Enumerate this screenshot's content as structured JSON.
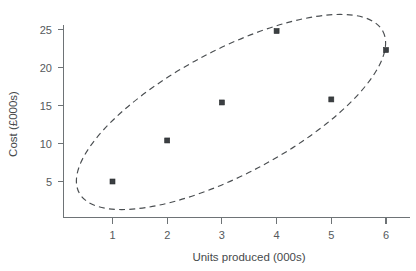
{
  "chart_data": {
    "type": "scatter",
    "title": "",
    "xlabel": "Units produced (000s)",
    "ylabel": "Cost (£000s)",
    "x": [
      1,
      2,
      3,
      4,
      5,
      6
    ],
    "values": [
      5.0,
      10.4,
      15.4,
      24.8,
      15.8,
      22.3
    ],
    "series": [
      {
        "name": "Cost vs units produced",
        "points": [
          {
            "x": 1,
            "y": 5.0
          },
          {
            "x": 2,
            "y": 10.4
          },
          {
            "x": 3,
            "y": 15.4
          },
          {
            "x": 4,
            "y": 24.8
          },
          {
            "x": 5,
            "y": 15.8
          },
          {
            "x": 6,
            "y": 22.3
          }
        ]
      }
    ],
    "xticks": [
      "1",
      "2",
      "3",
      "4",
      "5",
      "6"
    ],
    "yticks": [
      "5",
      "10",
      "15",
      "20",
      "25"
    ],
    "xlim": [
      0,
      6.6
    ],
    "ylim": [
      0,
      27
    ],
    "grid": false,
    "legend": null,
    "annotations": [
      {
        "name": "correlation-ellipse",
        "type": "dashed-ellipse",
        "description": "Dashed ellipse enclosing all data points, oriented along the positive correlation trend"
      }
    ],
    "marker": {
      "shape": "square",
      "color": "#3b3f42",
      "size": 5
    }
  },
  "axes": {
    "y": {
      "title": "Cost (£000s)",
      "ticks": [
        {
          "label": "25",
          "value": 25
        },
        {
          "label": "20",
          "value": 20
        },
        {
          "label": "15",
          "value": 15
        },
        {
          "label": "10",
          "value": 10
        },
        {
          "label": "5",
          "value": 5
        }
      ]
    },
    "x": {
      "title": "Units produced (000s)",
      "ticks": [
        {
          "label": "1",
          "value": 1
        },
        {
          "label": "2",
          "value": 2
        },
        {
          "label": "3",
          "value": 3
        },
        {
          "label": "4",
          "value": 4
        },
        {
          "label": "5",
          "value": 5
        },
        {
          "label": "6",
          "value": 6
        }
      ]
    }
  },
  "colors": {
    "axis": "#6e7376",
    "text": "#55595c",
    "marker": "#3b3f42",
    "ellipse": "#4a4e51",
    "background": "#ffffff"
  }
}
